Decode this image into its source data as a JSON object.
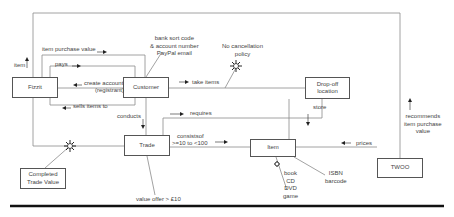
{
  "diagram": {
    "entities": [
      {
        "id": "fizzit",
        "label": "Fizzit"
      },
      {
        "id": "customer",
        "label": "Customer"
      },
      {
        "id": "dropoff",
        "label": "Drop-off location"
      },
      {
        "id": "trade",
        "label": "Trade"
      },
      {
        "id": "item",
        "label": "Item"
      },
      {
        "id": "twoo",
        "label": "TWOO"
      },
      {
        "id": "completed",
        "label": "Completed Trade Value"
      }
    ],
    "relationships": {
      "item": "item",
      "item_purchase_value": "item purchase value",
      "pays": "pays",
      "create_account": "create account",
      "registrant": "(registrant)",
      "sells_items_to": "sells items to",
      "take_items": "take items",
      "conducts": "conducts",
      "requires": "requires",
      "store": "store",
      "consists_of": "consistsof",
      "consists_range": ">=10 to <100",
      "prices": "prices",
      "recommends": "recommends item purchase value"
    },
    "annotations": {
      "bank": [
        "bank sort code",
        "& account number",
        "PayPal email"
      ],
      "no_cancel": [
        "No cancellation",
        "policy"
      ],
      "value_offer": "value offer > £10",
      "media": [
        "book",
        "CD",
        "DVD",
        "game"
      ],
      "isbn": [
        "ISBN",
        "barcode"
      ],
      "recommends_lines": [
        "recommends",
        "item purchase",
        "value"
      ]
    },
    "colors": {
      "line": "#777777",
      "text": "#444444",
      "rule": "#111111"
    }
  }
}
